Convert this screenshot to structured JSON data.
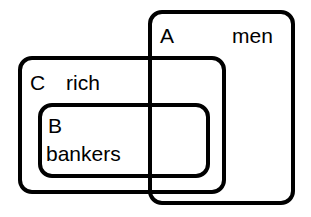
{
  "diagram": {
    "type": "euler-diagram",
    "width": 311,
    "height": 217,
    "background_color": "#ffffff",
    "stroke_color": "#000000",
    "stroke_width": 4,
    "corner_radius": 12,
    "sets": [
      {
        "id": "A",
        "letter": "A",
        "name": "men",
        "x": 150,
        "y": 12,
        "width": 143,
        "height": 191,
        "letter_x": 160,
        "letter_y": 37,
        "name_x": 232,
        "name_y": 37
      },
      {
        "id": "C",
        "letter": "C",
        "name": "rich",
        "x": 20,
        "y": 58,
        "width": 204,
        "height": 134,
        "letter_x": 30,
        "letter_y": 84,
        "name_x": 66,
        "name_y": 84
      },
      {
        "id": "B",
        "letter": "B",
        "name": "bankers",
        "x": 40,
        "y": 105,
        "width": 168,
        "height": 71,
        "letter_x": 48,
        "letter_y": 127,
        "name_x": 46,
        "name_y": 155
      }
    ]
  }
}
